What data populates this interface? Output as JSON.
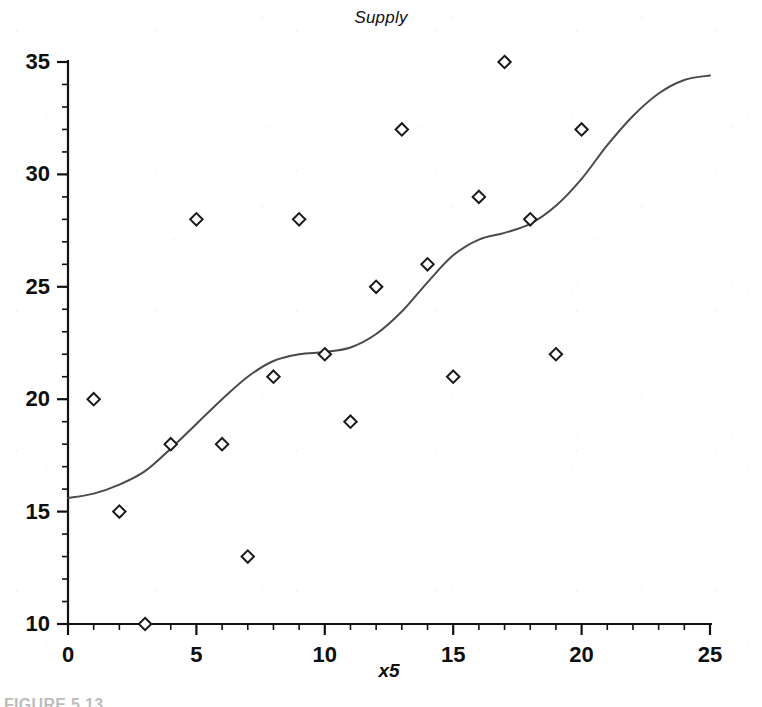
{
  "chart_data": {
    "type": "scatter",
    "title": "Supply",
    "xlabel": "x5",
    "ylabel": "",
    "xlim": [
      0,
      25
    ],
    "ylim": [
      10,
      35
    ],
    "grid": false,
    "legend": false,
    "x_ticks": [
      0,
      5,
      10,
      15,
      20,
      25
    ],
    "x_tick_labels": [
      "0",
      "5",
      "10",
      "15",
      "20",
      "25"
    ],
    "x_minor_tick_step": 1,
    "y_ticks": [
      10,
      15,
      20,
      25,
      30,
      35
    ],
    "y_tick_labels": [
      "10",
      "15",
      "20",
      "25",
      "30",
      "35"
    ],
    "y_minor_tick_step": 1,
    "marker": "open-diamond",
    "marker_color": "#1a1a1a",
    "line_color": "#4a4a4a",
    "series": [
      {
        "name": "Supply observations",
        "type": "scatter",
        "x": [
          1,
          2,
          3,
          4,
          5,
          6,
          7,
          8,
          9,
          10,
          11,
          12,
          13,
          14,
          15,
          16,
          17,
          18,
          19,
          20
        ],
        "y": [
          20,
          15,
          10,
          18,
          28,
          18,
          13,
          21,
          28,
          22,
          19,
          25,
          32,
          26,
          21,
          29,
          35,
          28,
          22,
          32
        ]
      },
      {
        "name": "Smoothed fit",
        "type": "line",
        "x": [
          0,
          1,
          2,
          3,
          4,
          5,
          6,
          7,
          8,
          9,
          10,
          11,
          12,
          13,
          14,
          15,
          16,
          17,
          18,
          19,
          20,
          21,
          22,
          23,
          24,
          25
        ],
        "y": [
          15.6,
          15.8,
          16.2,
          16.8,
          17.8,
          18.9,
          20.0,
          21.0,
          21.7,
          22.0,
          22.1,
          22.3,
          22.9,
          23.9,
          25.2,
          26.4,
          27.1,
          27.4,
          27.8,
          28.6,
          29.8,
          31.3,
          32.6,
          33.6,
          34.2,
          34.4
        ]
      }
    ]
  },
  "caption": {
    "text": "FIGURE 5.13"
  }
}
